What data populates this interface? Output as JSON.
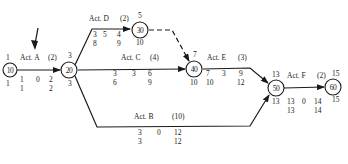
{
  "diagram": {
    "type": "activity-on-arrow network",
    "nodes": [
      {
        "id": "10",
        "label": "10",
        "top": "1",
        "bottom": "1"
      },
      {
        "id": "20",
        "label": "20",
        "top": "3",
        "bottom": "3"
      },
      {
        "id": "30",
        "label": "30",
        "top": "5",
        "bottom": "10"
      },
      {
        "id": "40",
        "label": "40",
        "top": "7",
        "bottom": "10"
      },
      {
        "id": "50",
        "label": "50",
        "top": "13",
        "bottom": "13"
      },
      {
        "id": "60",
        "label": "60",
        "top": "15",
        "bottom": "15"
      }
    ],
    "activities": [
      {
        "id": "A",
        "name": "Act. A",
        "duration": "(2)",
        "from": "10",
        "to": "20",
        "es": "1",
        "tf": "0",
        "ef": "2",
        "ls": "1",
        "lf": "2"
      },
      {
        "id": "D",
        "name": "Act. D",
        "duration": "(2)",
        "from": "20",
        "to": "30",
        "es": "3",
        "tf": "5",
        "ef": "4",
        "ls": "8",
        "lf": "9"
      },
      {
        "id": "C",
        "name": "Act. C",
        "duration": "(4)",
        "from": "20",
        "to": "40",
        "es": "3",
        "tf": "3",
        "ef": "6",
        "ls": "6",
        "lf": "9"
      },
      {
        "id": "B",
        "name": "Act. B",
        "duration": "(10)",
        "from": "20",
        "to": "50",
        "es": "3",
        "tf": "0",
        "ef": "12",
        "ls": "3",
        "lf": "12"
      },
      {
        "id": "E",
        "name": "Act. E",
        "duration": "(3)",
        "from": "40",
        "to": "50",
        "es": "7",
        "tf": "3",
        "ef": "9",
        "ls": "10",
        "lf": "12"
      },
      {
        "id": "F",
        "name": "Act. F",
        "duration": "(2)",
        "from": "50",
        "to": "60",
        "es": "13",
        "tf": "0",
        "ef": "14",
        "ls": "13",
        "lf": "14"
      }
    ],
    "dummy": {
      "from": "30",
      "to": "40",
      "style": "dashed"
    },
    "pointer": {
      "target": "Act. A",
      "shape": "arrow"
    }
  }
}
